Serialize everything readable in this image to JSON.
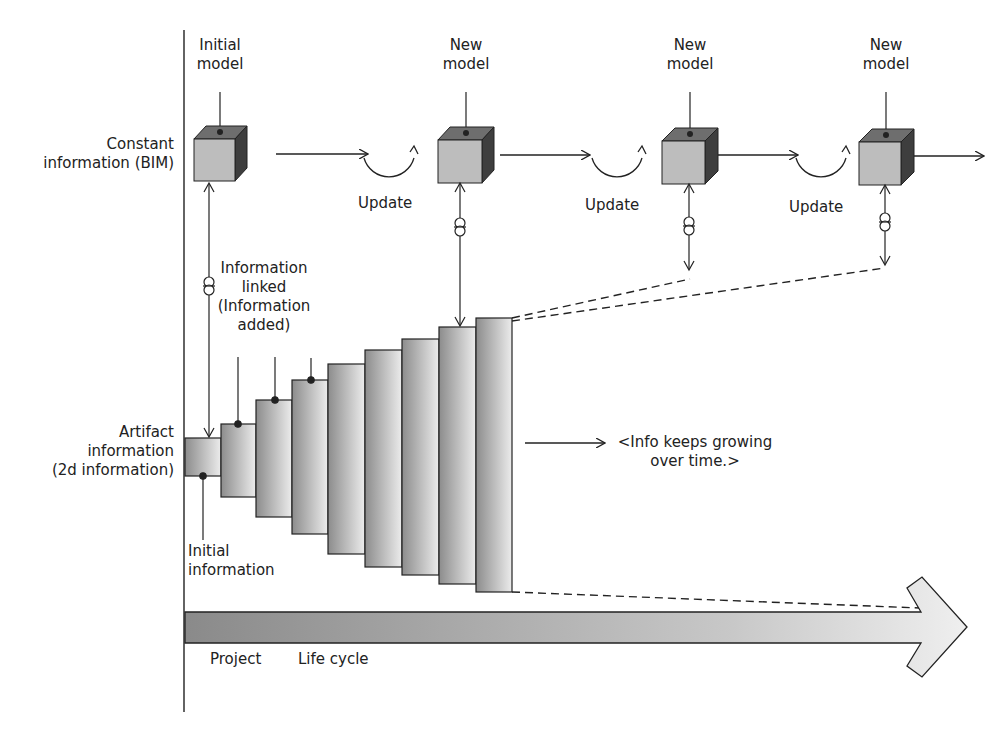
{
  "diagram": {
    "row_labels": {
      "constant": [
        "Constant",
        "information (BIM)"
      ],
      "artifact": [
        "Artifact",
        "information",
        "(2d information)"
      ]
    },
    "models": [
      {
        "label": [
          "Initial",
          "model"
        ],
        "x": 214
      },
      {
        "label": [
          "New",
          "model"
        ],
        "x": 456
      },
      {
        "label": [
          "New",
          "model"
        ],
        "x": 687
      },
      {
        "label": [
          "New",
          "model"
        ],
        "x": 884
      }
    ],
    "update_labels": [
      "Update",
      "Update",
      "Update"
    ],
    "annotations": {
      "info_linked": [
        "Information",
        "linked",
        "(Information",
        "added)"
      ],
      "initial_info": [
        "Initial",
        "information"
      ],
      "growing": [
        "<Info keeps growing",
        "over time.>"
      ]
    },
    "bars": [
      {
        "x": 185,
        "top": 438,
        "bottom": 476
      },
      {
        "x": 221,
        "top": 424,
        "bottom": 497
      },
      {
        "x": 256,
        "top": 400,
        "bottom": 517
      },
      {
        "x": 292,
        "top": 380,
        "bottom": 534
      },
      {
        "x": 328,
        "top": 364,
        "bottom": 554
      },
      {
        "x": 365,
        "top": 350,
        "bottom": 567
      },
      {
        "x": 402,
        "top": 339,
        "bottom": 575
      },
      {
        "x": 439,
        "top": 327,
        "bottom": 584
      },
      {
        "x": 476,
        "top": 318,
        "bottom": 592
      }
    ],
    "timeline": {
      "project_label": "Project",
      "lifecycle_label": "Life cycle"
    },
    "colors": {
      "line": "#222222",
      "cube_front": "#bdbdbd",
      "cube_top": "#6e6e6e",
      "cube_side": "#3e3e3e",
      "bar_dark": "#8a8a8a",
      "bar_light": "#e6e6e6"
    }
  }
}
